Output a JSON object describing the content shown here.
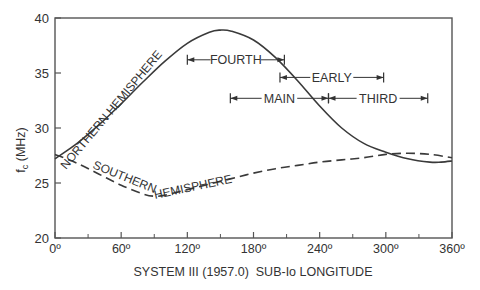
{
  "chart_data": {
    "type": "line",
    "title": "",
    "xlabel": "SYSTEM III (1957.0)  SUB-Io LONGITUDE",
    "ylabel": "f_c (MHz)",
    "xlim": [
      0,
      360
    ],
    "ylim": [
      20,
      40
    ],
    "x_ticks": [
      0,
      60,
      120,
      180,
      240,
      300,
      360
    ],
    "x_tick_labels": [
      "0º",
      "60º",
      "120º",
      "180º",
      "240º",
      "300º",
      "360º"
    ],
    "x_minor_ticks": [
      30,
      90,
      150,
      210,
      270,
      330
    ],
    "y_ticks": [
      20,
      25,
      30,
      35,
      40
    ],
    "y_tick_labels": [
      "20",
      "25",
      "30",
      "35",
      "40"
    ],
    "grid": false,
    "legend": "inline curve labels",
    "series": [
      {
        "name": "NORTHERN HEMISPHERE",
        "style": "solid",
        "x": [
          0,
          20,
          40,
          60,
          80,
          100,
          120,
          140,
          150,
          160,
          180,
          200,
          220,
          240,
          260,
          280,
          300,
          320,
          340,
          350,
          360
        ],
        "values": [
          27.2,
          28.6,
          30.3,
          32.2,
          34.2,
          36.1,
          37.7,
          38.7,
          38.9,
          38.8,
          38.0,
          36.4,
          34.3,
          32.0,
          30.0,
          28.6,
          27.8,
          27.2,
          26.9,
          26.9,
          27.0
        ]
      },
      {
        "name": "SOUTHERN HEMISPHERE",
        "style": "dashed",
        "x": [
          0,
          20,
          40,
          60,
          80,
          90,
          100,
          120,
          140,
          160,
          180,
          200,
          220,
          240,
          260,
          280,
          300,
          320,
          340,
          360
        ],
        "values": [
          27.6,
          26.8,
          25.8,
          24.8,
          24.0,
          23.8,
          23.9,
          24.4,
          24.9,
          25.4,
          25.9,
          26.3,
          26.6,
          26.9,
          27.1,
          27.3,
          27.6,
          27.7,
          27.6,
          27.3
        ]
      }
    ],
    "annotations": [
      {
        "label": "FOURTH",
        "start": 120,
        "end": 208,
        "y": 36.2
      },
      {
        "label": "EARLY",
        "start": 204,
        "end": 298,
        "y": 34.6
      },
      {
        "label": "MAIN",
        "start": 159,
        "end": 248,
        "y": 32.7
      },
      {
        "label": "THIRD",
        "start": 248,
        "end": 338,
        "y": 32.7
      }
    ]
  }
}
